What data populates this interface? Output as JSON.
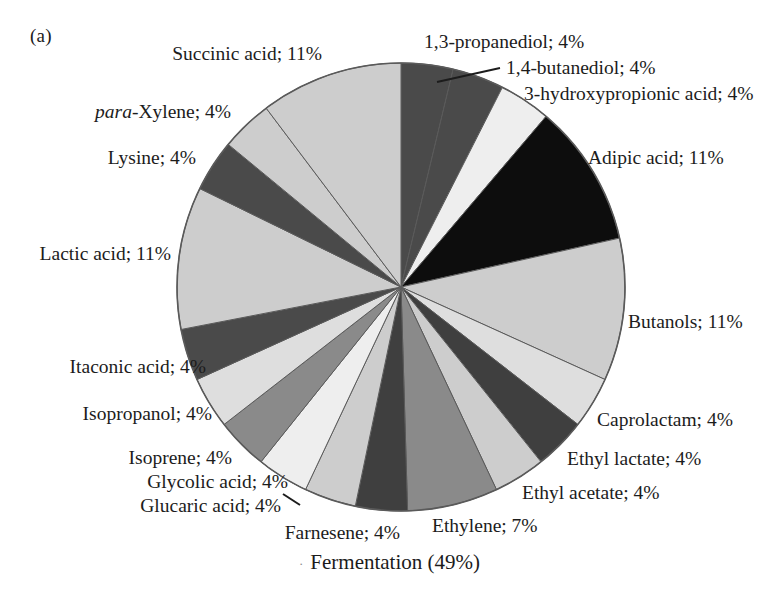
{
  "panel": {
    "label": "(a)"
  },
  "caption": {
    "dot": "·",
    "text": "Fermentation (49%)"
  },
  "colors": {
    "black": "#0d0d0d",
    "dark_gray": "#4a4a4a",
    "mid_gray": "#8a8a8a",
    "light_gray": "#cdcdcd",
    "pale_gray": "#dedede",
    "near_white": "#eeeeee",
    "outline": "#5a5a5a",
    "text": "#1c1c1c",
    "background": "#ffffff"
  },
  "chart_data": {
    "type": "pie",
    "title": "Fermentation (49%)",
    "panel_label": "(a)",
    "units": "percent",
    "start_angle_deg": 0,
    "direction": "clockwise",
    "total_label": "Fermentation (49%)",
    "legend_position": "outside-callout",
    "categories": [
      "1,3-propanediol",
      "1,4-butanediol",
      "3-hydroxypropionic acid",
      "Adipic acid",
      "Butanols",
      "Caprolactam",
      "Ethyl lactate",
      "Ethyl acetate",
      "Ethylene",
      "Farnesene",
      "Glucaric acid",
      "Glycolic acid",
      "Isoprene",
      "Isopropanol",
      "Itaconic acid",
      "Lactic acid",
      "Lysine",
      "para-Xylene",
      "Succinic acid"
    ],
    "values": [
      4,
      4,
      4,
      11,
      11,
      4,
      4,
      4,
      7,
      4,
      4,
      4,
      4,
      4,
      4,
      11,
      4,
      4,
      11
    ],
    "slices": [
      {
        "name": "1,3-propanediol",
        "label": "1,3-propanediol; 4%",
        "value": 4,
        "color": "#4a4a4a"
      },
      {
        "name": "1,4-butanediol",
        "label": "1,4-butanediol; 4%",
        "value": 4,
        "color": "#4a4a4a"
      },
      {
        "name": "3-hydroxypropionic acid",
        "label": "3-hydroxypropionic acid; 4%",
        "value": 4,
        "color": "#eeeeee"
      },
      {
        "name": "Adipic acid",
        "label": "Adipic acid; 11%",
        "value": 11,
        "color": "#0d0d0d"
      },
      {
        "name": "Butanols",
        "label": "Butanols; 11%",
        "value": 11,
        "color": "#cdcdcd"
      },
      {
        "name": "Caprolactam",
        "label": "Caprolactam; 4%",
        "value": 4,
        "color": "#dedede"
      },
      {
        "name": "Ethyl lactate",
        "label": "Ethyl lactate; 4%",
        "value": 4,
        "color": "#3f3f3f"
      },
      {
        "name": "Ethyl acetate",
        "label": "Ethyl acetate; 4%",
        "value": 4,
        "color": "#cdcdcd"
      },
      {
        "name": "Ethylene",
        "label": "Ethylene; 7%",
        "value": 7,
        "color": "#8a8a8a"
      },
      {
        "name": "Farnesene",
        "label": "Farnesene; 4%",
        "value": 4,
        "color": "#3f3f3f"
      },
      {
        "name": "Glucaric acid",
        "label": "Glucaric acid; 4%",
        "value": 4,
        "color": "#cdcdcd"
      },
      {
        "name": "Glycolic acid",
        "label": "Glycolic acid; 4%",
        "value": 4,
        "color": "#eeeeee"
      },
      {
        "name": "Isoprene",
        "label": "Isoprene; 4%",
        "value": 4,
        "color": "#8a8a8a"
      },
      {
        "name": "Isopropanol",
        "label": "Isopropanol; 4%",
        "value": 4,
        "color": "#dedede"
      },
      {
        "name": "Itaconic acid",
        "label": "Itaconic acid; 4%",
        "value": 4,
        "color": "#4a4a4a"
      },
      {
        "name": "Lactic acid",
        "label": "Lactic acid; 11%",
        "value": 11,
        "color": "#cdcdcd"
      },
      {
        "name": "Lysine",
        "label": "Lysine; 4%",
        "value": 4,
        "color": "#4a4a4a"
      },
      {
        "name": "para-Xylene",
        "label": "para-Xylene; 4%",
        "value": 4,
        "color": "#cdcdcd"
      },
      {
        "name": "Succinic acid",
        "label": "Succinic acid; 11%",
        "value": 11,
        "color": "#cdcdcd"
      }
    ]
  },
  "labels": {
    "propanediol": "1,3-propanediol; 4%",
    "butanediol": "1,4-butanediol; 4%",
    "hydroxyprop": "3-hydroxypropionic acid; 4%",
    "adipic": "Adipic acid; 11%",
    "butanols": "Butanols; 11%",
    "caprolactam": "Caprolactam; 4%",
    "ethyl_lactate": "Ethyl lactate; 4%",
    "ethyl_acetate": "Ethyl acetate; 4%",
    "ethylene": "Ethylene; 7%",
    "farnesene": "Farnesene; 4%",
    "glucaric": "Glucaric acid; 4%",
    "glycolic": "Glycolic acid; 4%",
    "isoprene": "Isoprene; 4%",
    "isopropanol": "Isopropanol; 4%",
    "itaconic": "Itaconic acid; 4%",
    "lactic": "Lactic acid; 11%",
    "lysine": "Lysine; 4%",
    "xylene_ital": "para",
    "xylene_rest": "-Xylene; 4%",
    "succinic": "Succinic acid; 11%"
  }
}
